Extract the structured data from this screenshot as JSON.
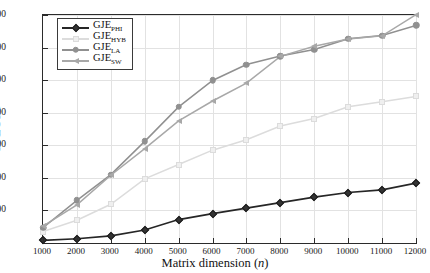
{
  "chart_data": {
    "type": "line",
    "title": "",
    "xlabel": "Matrix dimension (n)",
    "xlabel_prefix": "Matrix dimension (",
    "xlabel_italic": "n",
    "xlabel_suffix": ")",
    "ylabel": "GFLOPS",
    "x": [
      1000,
      2000,
      3000,
      4000,
      5000,
      6000,
      7000,
      8000,
      9000,
      10000,
      11000,
      12000
    ],
    "xticklabels": [
      "1000",
      "2000",
      "3000",
      "4000",
      "5000",
      "6000",
      "7000",
      "8000",
      "9000",
      "10000",
      "11000",
      "12000"
    ],
    "yticks": [
      100,
      200,
      300,
      400,
      500,
      600,
      700
    ],
    "yticklabels": [
      "100",
      "200",
      "300",
      "400",
      "500",
      "600",
      "700"
    ],
    "xlim": [
      1000,
      12000
    ],
    "ylim": [
      0,
      700
    ],
    "grid": true,
    "legend_position": "upper left",
    "series": [
      {
        "name": "GJE_PHI",
        "label_base": "GJE",
        "label_sub": "PHI",
        "marker": "diamond",
        "color": "#262626",
        "values": [
          8,
          13,
          22,
          40,
          72,
          90,
          107,
          124,
          141,
          155,
          163,
          184
        ]
      },
      {
        "name": "GJE_HYB",
        "label_base": "GJE",
        "label_sub": "HYB",
        "marker": "square",
        "color": "#dcdcdc",
        "values": [
          35,
          70,
          119,
          197,
          241,
          285,
          317,
          359,
          382,
          418,
          434,
          450
        ]
      },
      {
        "name": "GJE_LA",
        "label_base": "GJE",
        "label_sub": "LA",
        "marker": "circle",
        "color": "#909090",
        "values": [
          47,
          131,
          210,
          312,
          418,
          499,
          548,
          574,
          594,
          627,
          637,
          668
        ]
      },
      {
        "name": "GJE_SW",
        "label_base": "GJE",
        "label_sub": "SW",
        "marker": "triangle",
        "color": "#a8a8a8",
        "values": [
          52,
          117,
          208,
          290,
          375,
          436,
          491,
          573,
          604,
          626,
          636,
          701
        ]
      }
    ]
  }
}
